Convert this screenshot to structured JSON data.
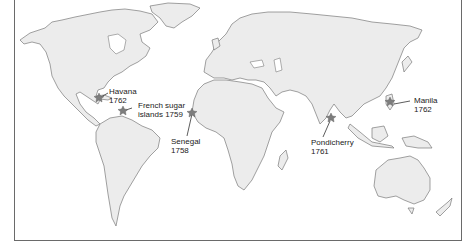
{
  "map": {
    "title": "",
    "colors": {
      "land": "#ececec",
      "coast": "#7a7a7a",
      "marker": "#7d7d7d",
      "frame": "#6a6a6a",
      "text": "#222222"
    },
    "locations": [
      {
        "name": "Havana",
        "year": "1762",
        "line1": "Havana",
        "line2": "1762",
        "marker_icon": "star-marker"
      },
      {
        "name": "French sugar islands",
        "year": "1759",
        "line1": "French sugar",
        "line2": "islands 1759",
        "marker_icon": "star-marker"
      },
      {
        "name": "Senegal",
        "year": "1758",
        "line1": "Senegal",
        "line2": "1758",
        "marker_icon": "star-marker"
      },
      {
        "name": "Pondicherry",
        "year": "1761",
        "line1": "Pondicherry",
        "line2": "1761",
        "marker_icon": "star-marker"
      },
      {
        "name": "Manila",
        "year": "1762",
        "line1": "Manila",
        "line2": "1762",
        "marker_icon": "star-marker"
      }
    ]
  }
}
